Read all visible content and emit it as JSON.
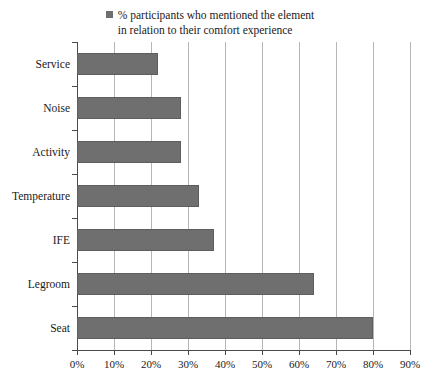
{
  "legend": {
    "marker": "legend-swatch",
    "line1": "% participants who mentioned the element",
    "line2": "in relation to their comfort experience"
  },
  "colors": {
    "bar_fill": "#6f6f6f",
    "bar_stroke": "#5e5e5e",
    "gridline": "#b6b6b6",
    "axis": "#4a4a4a",
    "background": "#ffffff"
  },
  "chart_data": {
    "type": "bar",
    "orientation": "horizontal",
    "title": "",
    "subtitle": "",
    "xlabel": "",
    "ylabel": "",
    "categories": [
      "Service",
      "Noise",
      "Activity",
      "Temperature",
      "IFE",
      "Legroom",
      "Seat"
    ],
    "values": [
      22,
      28,
      28,
      33,
      37,
      64,
      80
    ],
    "series": [
      {
        "name": "% participants who mentioned the element in relation to their comfort experience",
        "values": [
          22,
          28,
          28,
          33,
          37,
          64,
          80
        ]
      }
    ],
    "xlim": [
      0,
      90
    ],
    "xticks": [
      0,
      10,
      20,
      30,
      40,
      50,
      60,
      70,
      80,
      90
    ],
    "xticklabels": [
      "0%",
      "10%",
      "20%",
      "30%",
      "40%",
      "50%",
      "60%",
      "70%",
      "80%",
      "90%"
    ],
    "grid": "vertical",
    "legend_position": "top-center",
    "value_unit": "%"
  }
}
